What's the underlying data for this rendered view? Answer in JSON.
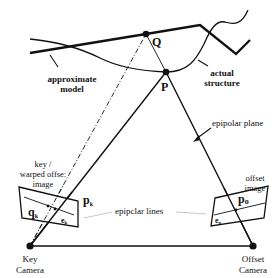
{
  "diagram": {
    "points": {
      "Q": "Q",
      "P": "P"
    },
    "labels": {
      "approximate_model": [
        "approximate",
        "model"
      ],
      "actual_structure": [
        "actual",
        "structure"
      ],
      "epipolar_plane": "epipolar plane",
      "key_image": [
        "key /",
        "warped offse:",
        "image"
      ],
      "offset_image": [
        "offset",
        "image"
      ],
      "epipolar_lines": "epipclar lines",
      "p_k": "p",
      "p_k_sub": "k",
      "p_o": "p",
      "p_o_sub": "o",
      "q_k": "q",
      "q_k_sub": "k",
      "e_k": "e",
      "e_k_sub": "k",
      "e_o": "e",
      "e_o_sub": "o",
      "key_camera": [
        "Key",
        "Camera"
      ],
      "offset_camera": [
        "Offset",
        "Camera"
      ]
    },
    "colors": {
      "ink": "#111111",
      "background": "#ffffff",
      "faint_line": "#bbbbbb"
    }
  }
}
